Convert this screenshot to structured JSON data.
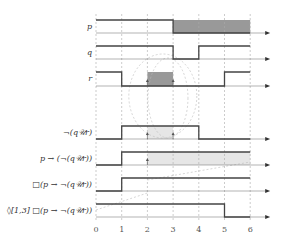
{
  "diagram": {
    "type": "timing-diagram",
    "time_axis": {
      "ticks": [
        "0",
        "1",
        "2",
        "3",
        "4",
        "5",
        "6"
      ]
    },
    "signals": [
      {
        "id": "p",
        "label": "p",
        "intervals_high": [
          [
            0,
            3
          ]
        ],
        "shaded": [
          [
            3,
            6
          ]
        ]
      },
      {
        "id": "q",
        "label": "q",
        "intervals_high": [
          [
            0,
            3
          ],
          [
            4,
            6
          ]
        ],
        "shaded": []
      },
      {
        "id": "r",
        "label": "r",
        "intervals_high": [
          [
            0,
            1
          ],
          [
            5,
            6
          ]
        ],
        "shaded": [
          [
            2,
            3
          ]
        ]
      },
      {
        "id": "not-q-until-r",
        "label": "¬(q𝒰r)",
        "intervals_high": [
          [
            1,
            4
          ]
        ],
        "shaded": [
          [
            2,
            3
          ]
        ]
      },
      {
        "id": "p-implies",
        "label": "p → (¬(q𝒰r))",
        "intervals_high": [
          [
            1,
            6
          ]
        ],
        "shaded": [
          [
            2,
            6
          ]
        ]
      },
      {
        "id": "always",
        "label": "□(p → ¬(q𝒰r))",
        "intervals_high": [
          [
            1,
            6
          ]
        ],
        "shaded": []
      },
      {
        "id": "eventually",
        "label": "◊[1,3] □(p → ¬(q𝒰r))",
        "intervals_high": [
          [
            0,
            5
          ]
        ],
        "shaded": []
      }
    ],
    "colors": {
      "signal": "#444444",
      "shade_dark": "#999999",
      "shade_light": "#e6e6e6",
      "grid": "#aaaaaa"
    }
  }
}
